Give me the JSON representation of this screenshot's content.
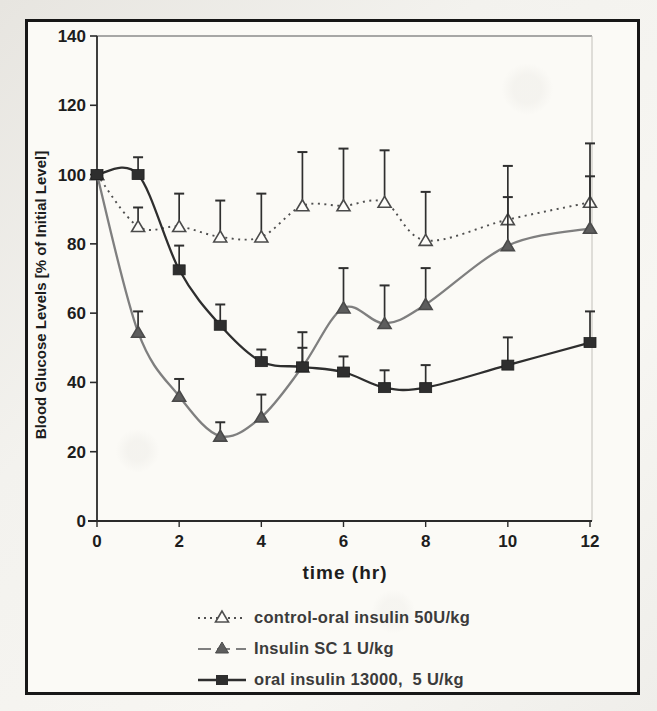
{
  "figure": {
    "kind": "scanned line chart with upper error bars",
    "frame_color": "#171717",
    "paper_color": "#fbfaf6"
  },
  "chart_data": {
    "type": "line",
    "x": [
      0,
      1,
      2,
      3,
      4,
      5,
      6,
      7,
      8,
      10,
      12
    ],
    "xlabel": "time (hr)",
    "ylabel": "Blood Glucose Levels [% of Initial Level]",
    "xlim": [
      0,
      12
    ],
    "ylim": [
      0,
      140
    ],
    "x_ticks": [
      0,
      2,
      4,
      6,
      8,
      10,
      12
    ],
    "y_ticks": [
      0,
      20,
      40,
      60,
      80,
      100,
      120,
      140
    ],
    "grid": false,
    "legend_position": "below plot, left-aligned",
    "error_bars": "upper only, capped",
    "series": [
      {
        "name": "control-oral insulin 50U/kg",
        "marker": "open-triangle",
        "line_style": "dotted",
        "color": "#4f4f4f",
        "marker_fill": "#fdfcf9",
        "values": [
          100,
          85,
          85,
          82,
          82,
          91,
          91,
          92,
          81,
          87,
          92
        ],
        "upper_error_tops": [
          100,
          90.5,
          94.5,
          92.5,
          94.5,
          106.5,
          107.5,
          107,
          95,
          102.5,
          109
        ]
      },
      {
        "name": "Insulin SC 1 U/kg",
        "marker": "filled-triangle",
        "line_style": "solid",
        "color": "#7f7f7f",
        "marker_fill": "#5d5d5d",
        "values": [
          100,
          54.5,
          36,
          24.5,
          30,
          44.5,
          61.5,
          57,
          62.5,
          79.5,
          84.5
        ],
        "upper_error_tops": [
          100,
          60.5,
          41,
          28.5,
          36.5,
          54.5,
          73,
          68,
          73,
          93.5,
          99.5
        ]
      },
      {
        "name": "oral insulin 13000,  5 U/kg",
        "marker": "filled-square",
        "line_style": "solid",
        "color": "#2e2e2e",
        "marker_fill": "#2e2e2e",
        "values": [
          100,
          100,
          72.5,
          56.5,
          46,
          44.5,
          43,
          38.5,
          38.5,
          45,
          51.5
        ],
        "upper_error_tops": [
          100,
          105,
          79.5,
          62.5,
          49.5,
          50,
          47.5,
          43.5,
          45,
          53,
          60.5
        ]
      }
    ]
  }
}
